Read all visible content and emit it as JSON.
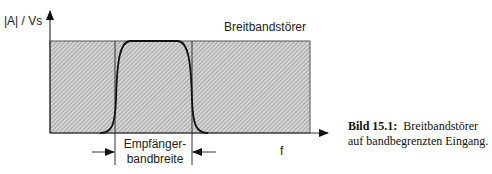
{
  "diagram": {
    "y_axis_label": "|A| / Vs",
    "x_axis_label": "f",
    "noise_label": "Breitbandstörer",
    "bandwidth_label_line1": "Empfänger-",
    "bandwidth_label_line2": "bandbreite"
  },
  "caption": {
    "number": "Bild 15.1:",
    "text_line1": "Breitbandstörer",
    "text_line2": "auf bandbegrenzten Eingang."
  },
  "colors": {
    "hatch": "#8a8a8a",
    "lines": "#333333",
    "curve": "#111111"
  }
}
